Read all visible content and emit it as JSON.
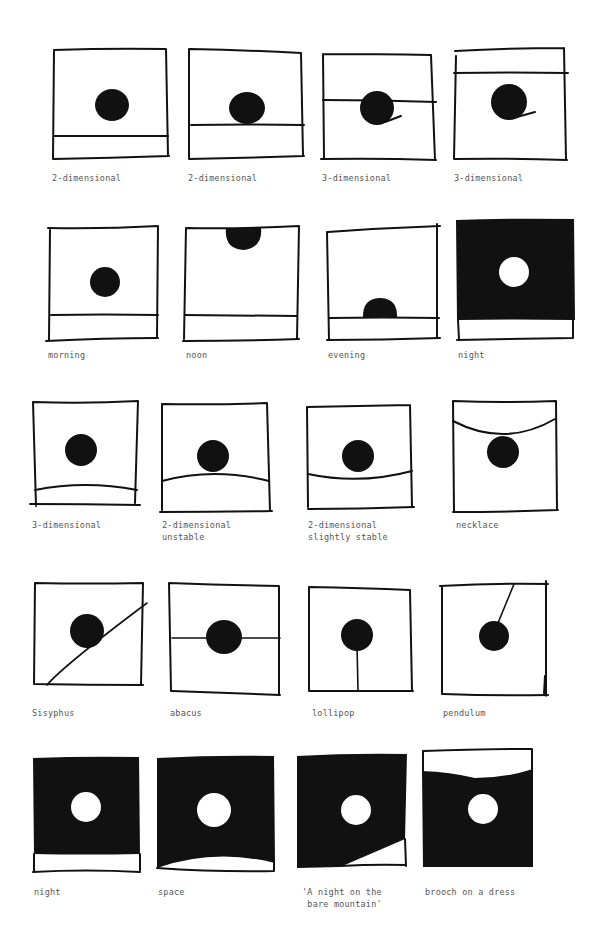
{
  "rows": [
    {
      "items": [
        {
          "caption": "2-dimensional",
          "description": "dot above a ground line near bottom"
        },
        {
          "caption": "2-dimensional",
          "description": "dot resting on ground line"
        },
        {
          "caption": "3-dimensional",
          "description": "horizon line passing through dot, with shadow stroke"
        },
        {
          "caption": "3-dimensional",
          "description": "horizon line near top, dot with shadow stroke"
        }
      ]
    },
    {
      "items": [
        {
          "caption": "morning",
          "description": "sun dot low-middle above ground"
        },
        {
          "caption": "noon",
          "description": "sun dot at top edge"
        },
        {
          "caption": "evening",
          "description": "sun dot setting on ground line"
        },
        {
          "caption": "night",
          "description": "black sky with white moon"
        }
      ]
    },
    {
      "items": [
        {
          "caption": "3-dimensional",
          "description": "dot above curved ground near bottom"
        },
        {
          "caption": "2-dimensional\nunstable",
          "description": "dot balanced on convex curve"
        },
        {
          "caption": "2-dimensional\nslightly stable",
          "description": "dot sitting in concave curve"
        },
        {
          "caption": "necklace",
          "description": "dot hanging from curved string"
        }
      ]
    },
    {
      "items": [
        {
          "caption": "Sisyphus",
          "description": "dot on diagonal slope"
        },
        {
          "caption": "abacus",
          "description": "dot threaded on horizontal line"
        },
        {
          "caption": "lollipop",
          "description": "dot on vertical stick"
        },
        {
          "caption": "pendulum",
          "description": "dot hanging from angled string"
        }
      ]
    },
    {
      "items": [
        {
          "caption": "night",
          "description": "black square with white moon and ground strip"
        },
        {
          "caption": "space",
          "description": "black square with white moon, curved ground"
        },
        {
          "caption": "'A night on the\n bare mountain'",
          "description": "black square with white moon, white diagonal slope"
        },
        {
          "caption": "brooch on a dress",
          "description": "black dress with white moon, white top band"
        }
      ]
    }
  ]
}
